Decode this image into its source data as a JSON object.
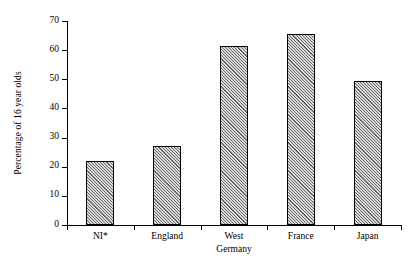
{
  "chart_data": {
    "type": "bar",
    "title": "",
    "xlabel": "",
    "ylabel": "Percentage of 16 year olds",
    "categories": [
      "NI*",
      "England",
      "West\nGermany",
      "France",
      "Japan"
    ],
    "values": [
      22,
      27,
      61.5,
      65.5,
      49.5
    ],
    "ylim": [
      0,
      70
    ],
    "ytick_labels": [
      "0",
      "10",
      "20",
      "30",
      "40",
      "50",
      "60",
      "70"
    ],
    "ytick_values": [
      0,
      10,
      20,
      30,
      40,
      50,
      60,
      70
    ],
    "grid": false,
    "legend": false,
    "bar_fill": "#d9d9d9",
    "bar_hatch": "diagonal",
    "bar_edge_color": "#000000",
    "axis_color": "#000000",
    "background": "#ffffff"
  }
}
